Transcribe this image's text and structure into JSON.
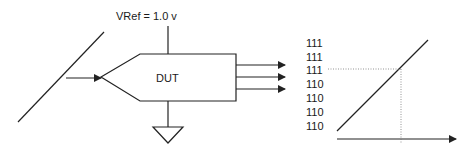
{
  "diagram": {
    "vref_label": "VRef = 1.0 v",
    "device_label": "DUT",
    "input": "ramp-signal",
    "output_arrows": 3,
    "ground": "ground-symbol"
  },
  "transfer_plot": {
    "y_codes": [
      "111",
      "111",
      "111",
      "110",
      "110",
      "110",
      "110"
    ],
    "highlighted_code_index": 2
  },
  "colors": {
    "line": "#222222",
    "dotted": "#777777",
    "background": "#ffffff"
  }
}
